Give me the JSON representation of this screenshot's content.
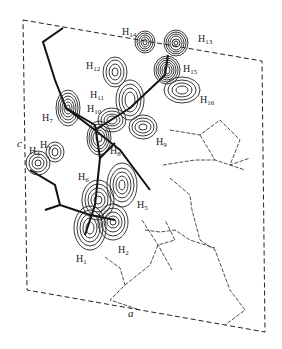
{
  "figure": {
    "type": "electron density contour map",
    "axes": {
      "a": "a",
      "c": "c"
    },
    "labels": [
      {
        "id": "H14",
        "base": "H",
        "sub": "14",
        "x": 122,
        "y": 27
      },
      {
        "id": "H13",
        "base": "H",
        "sub": "13",
        "x": 198,
        "y": 34
      },
      {
        "id": "H12",
        "base": "H",
        "sub": "12",
        "x": 86,
        "y": 61
      },
      {
        "id": "H15",
        "base": "H",
        "sub": "15",
        "x": 183,
        "y": 64
      },
      {
        "id": "H11",
        "base": "H",
        "sub": "11",
        "x": 90,
        "y": 90
      },
      {
        "id": "H16",
        "base": "H",
        "sub": "16",
        "x": 200,
        "y": 95
      },
      {
        "id": "H10",
        "base": "H",
        "sub": "10",
        "x": 87,
        "y": 104
      },
      {
        "id": "H7",
        "base": "H",
        "sub": "7",
        "x": 42,
        "y": 113
      },
      {
        "id": "H9",
        "base": "H",
        "sub": "9",
        "x": 156,
        "y": 137
      },
      {
        "id": "H3",
        "base": "H",
        "sub": "3",
        "x": 40,
        "y": 140
      },
      {
        "id": "H8",
        "base": "H",
        "sub": "8",
        "x": 110,
        "y": 146
      },
      {
        "id": "H4",
        "base": "H",
        "sub": "4",
        "x": 29,
        "y": 146
      },
      {
        "id": "H6",
        "base": "H",
        "sub": "6",
        "x": 78,
        "y": 172
      },
      {
        "id": "H5",
        "base": "H",
        "sub": "5",
        "x": 137,
        "y": 200
      },
      {
        "id": "H2",
        "base": "H",
        "sub": "2",
        "x": 118,
        "y": 245
      },
      {
        "id": "H1",
        "base": "H",
        "sub": "1",
        "x": 76,
        "y": 254
      }
    ]
  }
}
